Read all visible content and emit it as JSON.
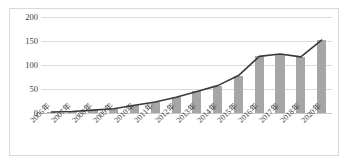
{
  "chart_data": {
    "type": "bar",
    "title": "",
    "subtitle": "",
    "xlabel": "",
    "ylabel": "",
    "ylim": [
      0,
      200
    ],
    "yticks": [
      0,
      50,
      100,
      150,
      200
    ],
    "grid": true,
    "legend": "none",
    "categories": [
      "2006年",
      "2007年",
      "2008年",
      "2009年",
      "2010年",
      "2011年",
      "2012年",
      "2013年",
      "2014年",
      "2015年",
      "2016年",
      "2017年",
      "2018年",
      "2020年"
    ],
    "series": [
      {
        "name": "bars",
        "type": "bar",
        "color": "#a6a6a6",
        "values": [
          2,
          3,
          6,
          9,
          16,
          23,
          33,
          45,
          57,
          78,
          118,
          123,
          117,
          152
        ]
      },
      {
        "name": "trend-line",
        "type": "line",
        "color": "#3a3a3a",
        "values": [
          2,
          3,
          6,
          9,
          16,
          23,
          33,
          45,
          57,
          78,
          118,
          123,
          117,
          152
        ]
      }
    ]
  },
  "axis": {
    "y_tick_labels": [
      "200",
      "150",
      "100",
      "50",
      "0"
    ]
  }
}
